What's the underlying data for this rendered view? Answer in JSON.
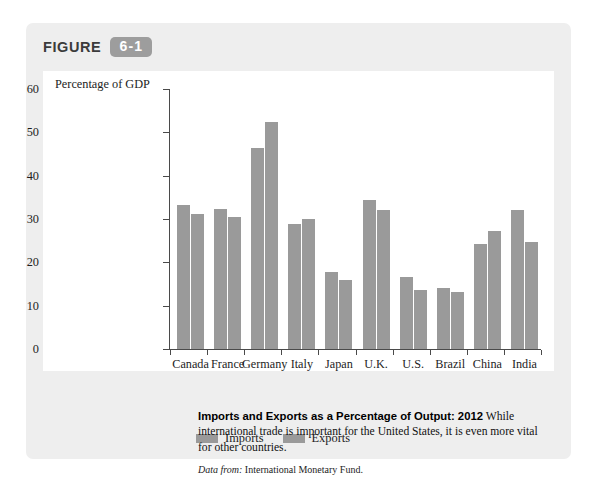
{
  "figure": {
    "label": "FIGURE",
    "number": "6-1"
  },
  "colors": {
    "card_background": "#eeeeee",
    "plot_background": "#ffffff",
    "bar_fill": "#9a9a9a",
    "badge_fill": "#9d9d9d",
    "axis": "#4a4a4a"
  },
  "legend": {
    "items": [
      {
        "label": "Imports"
      },
      {
        "label": "Exports"
      }
    ]
  },
  "caption": {
    "title": "Imports and Exports as a Percentage of Output: 2012",
    "body": "While international trade is important for the United States, it is even more vital for other countries.",
    "source_label": "Data from:",
    "source_value": "International Monetary Fund."
  },
  "chart_data": {
    "type": "bar",
    "title": "Imports and Exports as a Percentage of Output: 2012",
    "xlabel": "",
    "ylabel": "Percentage of GDP",
    "ylim": [
      0,
      60
    ],
    "yticks": [
      0,
      10,
      20,
      30,
      40,
      50,
      60
    ],
    "grid": false,
    "legend_position": "below-plot-left",
    "categories": [
      "Canada",
      "France",
      "Germany",
      "Italy",
      "Japan",
      "U.K.",
      "U.S.",
      "Brazil",
      "China",
      "India"
    ],
    "series": [
      {
        "name": "Imports",
        "values": [
          33.2,
          32.4,
          46.3,
          28.9,
          17.7,
          34.3,
          16.7,
          14.0,
          24.2,
          32.1
        ]
      },
      {
        "name": "Exports",
        "values": [
          31.1,
          30.4,
          52.3,
          30.0,
          15.9,
          32.0,
          13.6,
          13.1,
          27.3,
          24.6
        ]
      }
    ]
  }
}
